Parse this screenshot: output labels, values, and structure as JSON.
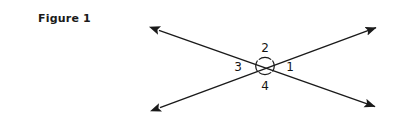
{
  "figure": {
    "caption": "Figure 1",
    "background_color": "#ffffff",
    "stroke_color": "#1a1a1a",
    "label_color": "#141414"
  },
  "diagram": {
    "type": "vertical-angles-intersecting-lines",
    "intersection": {
      "x": 265,
      "y": 66
    },
    "lines": [
      {
        "name": "line-a",
        "from": {
          "x": 155,
          "y": 29
        },
        "to": {
          "x": 379,
          "y": 108
        },
        "arrowheads": "both"
      },
      {
        "name": "line-b",
        "from": {
          "x": 156,
          "y": 109
        },
        "to": {
          "x": 380,
          "y": 26
        },
        "arrowheads": "both"
      }
    ],
    "arcs": [
      {
        "name": "angle-arc-right",
        "position": "right"
      },
      {
        "name": "angle-arc-top",
        "position": "top"
      },
      {
        "name": "angle-arc-left",
        "position": "left"
      },
      {
        "name": "angle-arc-bottom",
        "position": "bottom"
      }
    ],
    "labels": [
      {
        "name": "angle-label-1",
        "text": "1",
        "position": "right",
        "x": 290,
        "y": 71
      },
      {
        "name": "angle-label-2",
        "text": "2",
        "position": "top",
        "x": 265,
        "y": 52
      },
      {
        "name": "angle-label-3",
        "text": "3",
        "position": "left",
        "x": 238,
        "y": 71
      },
      {
        "name": "angle-label-4",
        "text": "4",
        "position": "bottom",
        "x": 265,
        "y": 90
      }
    ]
  }
}
